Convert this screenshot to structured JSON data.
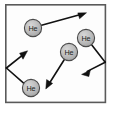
{
  "figure": {
    "type": "particle-motion-diagram",
    "background_color": "#ffffff"
  },
  "container": {
    "name": "gas-container",
    "x": 5,
    "y": 4,
    "width": 101,
    "height": 99,
    "stroke_color": "#5a5a5a",
    "fill_color": "#fdfdfd",
    "stroke_width": 1.6
  },
  "atom_style": {
    "radius": 8.6,
    "fill_color": "#b9b9b9",
    "stroke_color": "#4a4a4a",
    "label_color": "#1a1a1a"
  },
  "arrow_style": {
    "stroke_color": "#111111",
    "stroke_width": 1.5,
    "head_color": "#111111"
  },
  "atoms": [
    {
      "id": "atom-1",
      "label": "He",
      "cx": 33,
      "cy": 28
    },
    {
      "id": "atom-2",
      "label": "He",
      "cx": 86,
      "cy": 38
    },
    {
      "id": "atom-3",
      "label": "He",
      "cx": 69,
      "cy": 52
    },
    {
      "id": "atom-4",
      "label": "He",
      "cx": 31,
      "cy": 88
    }
  ],
  "velocity_vectors": [
    {
      "id": "vector-1",
      "name": "velocity-vector-atom-1",
      "from_atom": "atom-1",
      "points": "41,25 85,13",
      "head_at": [
        85,
        13
      ],
      "head_angle_deg": -15
    },
    {
      "id": "vector-2",
      "name": "velocity-vector-atom-2-bounce",
      "from_atom": "atom-2",
      "points": "92,45 105,62 83,74",
      "head_at": [
        83,
        74
      ],
      "head_angle_deg": 152,
      "note": "reflects off right wall"
    },
    {
      "id": "vector-3",
      "name": "velocity-vector-atom-3",
      "from_atom": "atom-3",
      "points": "64,60 46,88",
      "head_at": [
        46,
        88
      ],
      "head_angle_deg": 123
    },
    {
      "id": "vector-4",
      "name": "velocity-vector-atom-4-bounce",
      "from_atom": "atom-4",
      "points": "24,84 6,68 26,51",
      "head_at": [
        26,
        51
      ],
      "head_angle_deg": -40,
      "note": "reflects off left wall"
    }
  ]
}
